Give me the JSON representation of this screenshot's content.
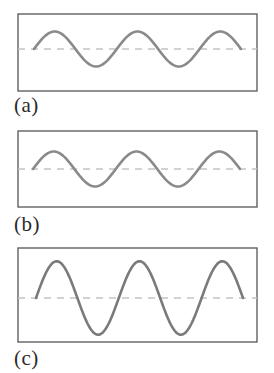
{
  "figure": {
    "colors": {
      "frame": "#555555",
      "wave": "#8a8a8a",
      "wave_c": "#7a7a7a",
      "midline": "#c4c4c4",
      "label": "#2a2a2a"
    },
    "panels": [
      {
        "id": "a",
        "label": "(a)",
        "cycles": 2.5,
        "relative_amplitude": 1.0,
        "relative_wavelength": 1.0,
        "start_phase": "midline-rising"
      },
      {
        "id": "b",
        "label": "(b)",
        "cycles": 2.5,
        "relative_amplitude": 1.0,
        "relative_wavelength": 1.0,
        "start_phase": "midline-rising"
      },
      {
        "id": "c",
        "label": "(c)",
        "cycles": 2.5,
        "relative_amplitude": 2.1,
        "relative_wavelength": 1.0,
        "start_phase": "midline-rising"
      }
    ]
  }
}
